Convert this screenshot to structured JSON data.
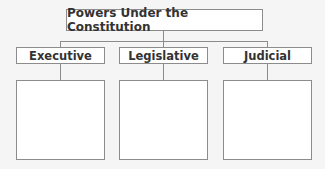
{
  "diagram": {
    "title": "Powers Under the Constitution",
    "branches": [
      {
        "label": "Executive",
        "content": ""
      },
      {
        "label": "Legislative",
        "content": ""
      },
      {
        "label": "Judicial",
        "content": ""
      }
    ]
  },
  "colors": {
    "background": "#f5f5f5",
    "box_fill": "#ffffff",
    "border": "#8c8c8c",
    "text": "#333333"
  }
}
